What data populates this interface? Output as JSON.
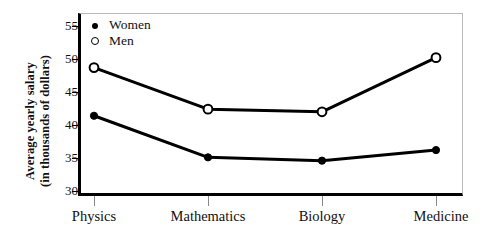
{
  "chart_data": {
    "type": "line",
    "title": "",
    "xlabel": "",
    "ylabel": "Average yearly salary (in thousands of dollars)",
    "ylabel_line1": "Average yearly salary",
    "ylabel_line2": "(in thousands of dollars)",
    "categories": [
      "Physics",
      "Mathematics",
      "Biology",
      "Medicine"
    ],
    "series": [
      {
        "name": "Women",
        "marker": "filled-circle",
        "color": "#000000",
        "values": [
          41.4,
          35.1,
          34.6,
          36.2
        ]
      },
      {
        "name": "Men",
        "marker": "open-circle",
        "color": "#000000",
        "values": [
          48.7,
          42.4,
          42.0,
          50.2
        ]
      }
    ],
    "ylim": [
      29,
      56.5
    ],
    "yticks": [
      30,
      35,
      40,
      45,
      50,
      55
    ],
    "ytick_labels": [
      "30",
      "35",
      "40",
      "45",
      "50",
      "55"
    ],
    "grid": false,
    "legend_position": "top-left",
    "legend_entries": [
      "Women",
      "Men"
    ]
  },
  "axes": {
    "y_title_line1": "Average yearly salary",
    "y_title_line2": "(in thousands of dollars)"
  },
  "legend": {
    "women_label": "Women",
    "men_label": "Men"
  }
}
